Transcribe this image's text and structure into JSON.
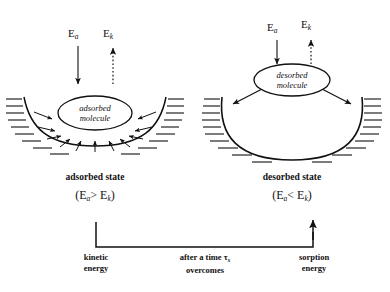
{
  "figure": {
    "type": "scientific-diagram"
  },
  "panels": [
    {
      "id": "left",
      "molecule_label_line1": "adsorbed",
      "molecule_label_line2": "molecule",
      "state_label": "adsorbed state",
      "condition_E": "E",
      "condition_sub1": "a",
      "condition_op": ">",
      "condition_sub2": "k",
      "energy_arrows": [
        {
          "name": "Ea",
          "symbol": "E",
          "sub": "a",
          "direction": "down",
          "style": "solid"
        },
        {
          "name": "Ek",
          "symbol": "E",
          "sub": "k",
          "direction": "up",
          "style": "dotted"
        }
      ],
      "well_shape": "shallow-parabolic",
      "radial_arrows": "inward"
    },
    {
      "id": "right",
      "molecule_label_line1": "desorbed",
      "molecule_label_line2": "molecule",
      "state_label": "desorbed state",
      "condition_E": "E",
      "condition_sub1": "a",
      "condition_op": "<",
      "condition_sub2": "k",
      "energy_arrows": [
        {
          "name": "Ea",
          "symbol": "E",
          "sub": "a",
          "direction": "down",
          "style": "solid"
        },
        {
          "name": "Ek",
          "symbol": "E",
          "sub": "k",
          "direction": "up",
          "style": "dotted"
        }
      ],
      "well_shape": "deep-u",
      "radial_arrows": "outward"
    }
  ],
  "footer": {
    "left_line1": "kinetic",
    "left_line2": "energy",
    "center_line1_pre": "after a time ",
    "center_tau": "τ",
    "center_tau_sub": "s",
    "center_line2": "overcomes",
    "right_line1": "sorption",
    "right_line2": "energy"
  },
  "colors": {
    "ink": "#111111",
    "background": "#ffffff"
  }
}
